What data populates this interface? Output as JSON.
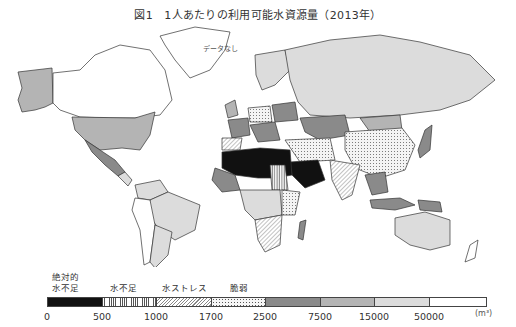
{
  "title": "図1　1人あたりの利用可能水資源量（2013年）",
  "map": {
    "nodata_label": "データなし",
    "categories": [
      {
        "id": "absolute",
        "label": "絶対的\n水不足",
        "range": [
          0,
          500
        ],
        "fill": "#111111",
        "pattern": "solid"
      },
      {
        "id": "scarcity",
        "label": "水不足",
        "range": [
          500,
          1000
        ],
        "fill": "#ffffff",
        "pattern": "vertical-lines"
      },
      {
        "id": "stress",
        "label": "水ストレス",
        "range": [
          1000,
          1700
        ],
        "fill": "#ffffff",
        "pattern": "diagonal-lines"
      },
      {
        "id": "vulnerable",
        "label": "脆弱",
        "range": [
          1700,
          2500
        ],
        "fill": "#ffffff",
        "pattern": "dots"
      },
      {
        "id": "c5",
        "label": "",
        "range": [
          2500,
          7500
        ],
        "fill": "#8a8a8a",
        "pattern": "solid"
      },
      {
        "id": "c6",
        "label": "",
        "range": [
          7500,
          15000
        ],
        "fill": "#b4b4b4",
        "pattern": "solid"
      },
      {
        "id": "c7",
        "label": "",
        "range": [
          15000,
          50000
        ],
        "fill": "#dcdcdc",
        "pattern": "solid"
      },
      {
        "id": "c8",
        "label": "",
        "range": [
          50000,
          null
        ],
        "fill": "#ffffff",
        "pattern": "solid"
      }
    ]
  },
  "legend": {
    "labels": {
      "absolute_line1": "絶対的",
      "absolute_line2": "水不足",
      "scarcity": "水不足",
      "stress": "水ストレス",
      "vulnerable": "脆弱"
    },
    "ticks": [
      "0",
      "500",
      "1000",
      "1700",
      "2500",
      "7500",
      "15000",
      "50000"
    ],
    "unit": "(m³)"
  }
}
